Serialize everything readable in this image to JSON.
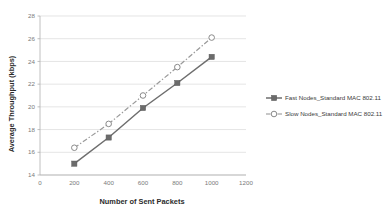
{
  "chart_data": {
    "type": "line",
    "title": "",
    "xlabel": "Number of Sent Packets",
    "ylabel": "Average Throughput (kbps)",
    "x": [
      200,
      400,
      600,
      800,
      1000
    ],
    "xlim": [
      0,
      1200
    ],
    "ylim": [
      14,
      28
    ],
    "xticks": [
      0,
      200,
      400,
      600,
      800,
      1000,
      1200
    ],
    "yticks": [
      14,
      16,
      18,
      20,
      22,
      24,
      26,
      28
    ],
    "grid": "horizontal",
    "legend_position": "right",
    "series": [
      {
        "name": "Fast Nodes_Standard MAC 802.11",
        "values": [
          15.0,
          17.3,
          19.9,
          22.1,
          24.4
        ],
        "marker": "filled-square",
        "line_style": "solid",
        "color": "#6e6e6e"
      },
      {
        "name": "Slow Nodes_Standard MAC 802.11",
        "values": [
          16.4,
          18.5,
          21.0,
          23.5,
          26.1
        ],
        "marker": "open-circle",
        "line_style": "dash-dot",
        "color": "#9a9a9a"
      }
    ]
  },
  "axes": {
    "x_tick_labels": [
      "0",
      "200",
      "400",
      "600",
      "800",
      "1000",
      "1200"
    ],
    "y_tick_labels": [
      "14",
      "16",
      "18",
      "20",
      "22",
      "24",
      "26",
      "28"
    ],
    "x_title": "Number of Sent Packets",
    "y_title": "Average Throughput (kbps)"
  },
  "legend": {
    "items": [
      {
        "label": "Fast Nodes_Standard MAC 802.11",
        "marker": "filled-square-line-icon"
      },
      {
        "label": "Slow Nodes_Standard MAC 802.11",
        "marker": "open-circle-dash-icon"
      }
    ]
  }
}
